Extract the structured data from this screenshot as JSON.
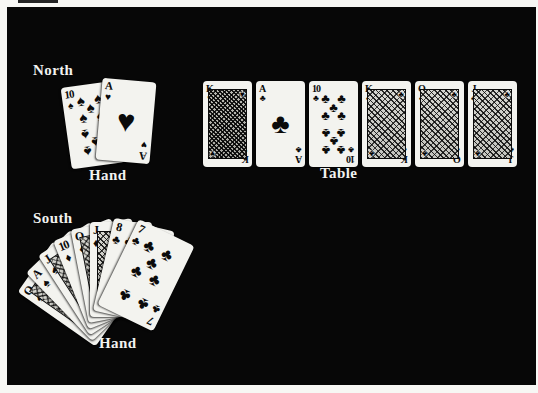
{
  "labels": {
    "north": "North",
    "north_hand": "Hand",
    "table": "Table",
    "south": "South",
    "south_hand": "Hand"
  },
  "suits": {
    "spade": "♠",
    "heart": "♥",
    "diamond": "♦",
    "club": "♣"
  },
  "colors": {
    "screen_bg": "#070707",
    "card": "#f3f3ef",
    "ink": "#0b0b0b",
    "label_text": "#f2f2f0",
    "page_margin": "#f7f7f4"
  },
  "groups": [
    {
      "name": "north-hand",
      "cards": [
        {
          "rank": "10",
          "suit": "spade",
          "kind": "pips",
          "x": 59,
          "y": 77,
          "w": 54,
          "h": 82,
          "rot": -8,
          "z": 1
        },
        {
          "rank": "A",
          "suit": "heart",
          "kind": "ace",
          "x": 92,
          "y": 73,
          "w": 54,
          "h": 82,
          "rot": 5,
          "z": 2
        }
      ]
    },
    {
      "name": "table-cards",
      "cards": [
        {
          "rank": "K",
          "suit": "heart",
          "kind": "court",
          "dense": true,
          "x": 196,
          "y": 74,
          "w": 49,
          "h": 86,
          "rot": 0,
          "z": 1
        },
        {
          "rank": "A",
          "suit": "club",
          "kind": "ace",
          "x": 249,
          "y": 74,
          "w": 49,
          "h": 86,
          "rot": 0,
          "z": 1
        },
        {
          "rank": "10",
          "suit": "club",
          "kind": "pips",
          "x": 302,
          "y": 74,
          "w": 49,
          "h": 86,
          "rot": 0,
          "z": 1
        },
        {
          "rank": "K",
          "suit": "club",
          "kind": "court",
          "x": 355,
          "y": 74,
          "w": 49,
          "h": 86,
          "rot": 0,
          "z": 1
        },
        {
          "rank": "Q",
          "suit": "club",
          "kind": "court",
          "x": 408,
          "y": 74,
          "w": 49,
          "h": 86,
          "rot": 0,
          "z": 1
        },
        {
          "rank": "J",
          "suit": "club",
          "kind": "court",
          "x": 461,
          "y": 74,
          "w": 49,
          "h": 86,
          "rot": 0,
          "z": 1
        }
      ]
    },
    {
      "name": "south-hand",
      "cards": [
        {
          "rank": "Q",
          "suit": "spade",
          "kind": "court",
          "x": 83,
          "y": 215,
          "w": 62,
          "h": 95,
          "rot": -55,
          "z": 1,
          "origin": "50% 110%"
        },
        {
          "rank": "A",
          "suit": "spade",
          "kind": "ace",
          "x": 83,
          "y": 215,
          "w": 62,
          "h": 95,
          "rot": -44,
          "z": 2,
          "origin": "50% 110%"
        },
        {
          "rank": "J",
          "suit": "spade",
          "kind": "court",
          "x": 83,
          "y": 215,
          "w": 62,
          "h": 95,
          "rot": -33,
          "z": 3,
          "origin": "50% 110%"
        },
        {
          "rank": "10",
          "suit": "diamond",
          "kind": "pips",
          "x": 83,
          "y": 215,
          "w": 62,
          "h": 95,
          "rot": -22,
          "z": 4,
          "origin": "50% 110%"
        },
        {
          "rank": "Q",
          "suit": "diamond",
          "kind": "court",
          "x": 83,
          "y": 215,
          "w": 62,
          "h": 95,
          "rot": -11,
          "z": 5,
          "origin": "50% 110%"
        },
        {
          "rank": "J",
          "suit": "diamond",
          "kind": "court",
          "x": 83,
          "y": 215,
          "w": 62,
          "h": 95,
          "rot": 0,
          "z": 6,
          "origin": "50% 110%"
        },
        {
          "rank": "8",
          "suit": "club",
          "kind": "pips",
          "x": 83,
          "y": 215,
          "w": 62,
          "h": 95,
          "rot": 13,
          "z": 7,
          "origin": "50% 110%"
        },
        {
          "rank": "7",
          "suit": "club",
          "kind": "pips",
          "x": 83,
          "y": 215,
          "w": 62,
          "h": 95,
          "rot": 26,
          "z": 8,
          "origin": "50% 110%"
        }
      ]
    }
  ]
}
